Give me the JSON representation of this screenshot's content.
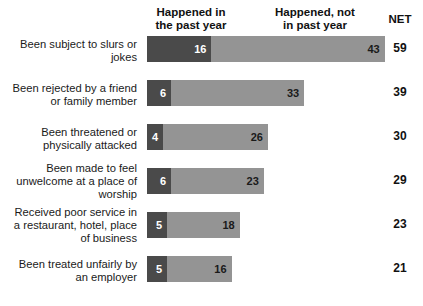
{
  "header": {
    "col_happened_past": "Happened in\nthe past year",
    "col_happened_past_line1": "Happened in",
    "col_happened_past_line2": "the past year",
    "col_happened_not_line1": "Happened, not",
    "col_happened_not_line2": "in past year",
    "col_net": "NET"
  },
  "colors": {
    "dark_segment": "#4a4a4a",
    "light_segment": "#949494",
    "background": "#ffffff",
    "text": "#1a1a1a"
  },
  "chart_data": {
    "type": "bar",
    "title": "",
    "subtitle": "",
    "xlabel": "",
    "ylabel": "",
    "orientation": "horizontal",
    "stacked": true,
    "grid": false,
    "legend_position": "top",
    "xlim": [
      0,
      59
    ],
    "units": "percent",
    "categories": [
      "Been subject to slurs or jokes",
      "Been rejected by a friend or family member",
      "Been threatened or physically attacked",
      "Been made to feel unwelcome at a place of worship",
      "Received poor service in a restaurant, hotel, place of business",
      "Been treated unfairly by an employer"
    ],
    "category_lines": [
      [
        "Been subject to slurs or",
        "jokes"
      ],
      [
        "Been rejected by a friend",
        "or family member"
      ],
      [
        "Been threatened or",
        "physically attacked"
      ],
      [
        "Been made to feel",
        "unwelcome at a place of",
        "worship"
      ],
      [
        "Received poor service in",
        "a restaurant, hotel, place",
        "of business"
      ],
      [
        "Been treated unfairly by",
        "an employer"
      ]
    ],
    "series": [
      {
        "name": "Happened in the past year",
        "color": "#4a4a4a",
        "values": [
          16,
          6,
          4,
          6,
          5,
          5
        ]
      },
      {
        "name": "Happened, not in past year",
        "color": "#949494",
        "values": [
          43,
          33,
          26,
          23,
          18,
          16
        ]
      }
    ],
    "net": [
      59,
      39,
      30,
      29,
      23,
      21
    ]
  },
  "rows": [
    {
      "label_lines": [
        "Been subject to slurs or",
        "jokes"
      ],
      "past": 16,
      "not_past": 43,
      "net": 59
    },
    {
      "label_lines": [
        "Been rejected by a friend",
        "or family member"
      ],
      "past": 6,
      "not_past": 33,
      "net": 39
    },
    {
      "label_lines": [
        "Been threatened or",
        "physically attacked"
      ],
      "past": 4,
      "not_past": 26,
      "net": 30
    },
    {
      "label_lines": [
        "Been made to feel",
        "unwelcome at a place of",
        "worship"
      ],
      "past": 6,
      "not_past": 23,
      "net": 29
    },
    {
      "label_lines": [
        "Received poor service in",
        "a restaurant, hotel, place",
        "of business"
      ],
      "past": 5,
      "not_past": 18,
      "net": 23
    },
    {
      "label_lines": [
        "Been treated unfairly by",
        "an employer"
      ],
      "past": 5,
      "not_past": 16,
      "net": 21
    }
  ],
  "layout": {
    "px_per_unit": 4.03,
    "bar_height": 26,
    "row_tops": [
      8,
      52,
      96,
      140,
      184,
      228
    ],
    "label_tops": [
      10,
      54,
      98,
      134,
      178,
      230
    ]
  }
}
